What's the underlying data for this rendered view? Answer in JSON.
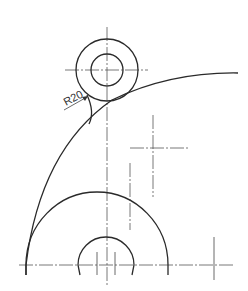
{
  "drawing": {
    "type": "mechanical-drawing",
    "colors": {
      "background": "#ffffff",
      "line": "#2a2a2a",
      "centerline": "#555555"
    },
    "annotations": [
      {
        "id": "fillet-radius",
        "label": "R20"
      }
    ],
    "features": {
      "top_boss": {
        "outer_circle": "outer-circle",
        "inner_circle": "inner-hole"
      },
      "base": {
        "outer_arc": "large-semicircle",
        "inner_arc": "small-semicircle"
      },
      "outline_arc": "large-outline-arc",
      "fillet": "fillet-arc"
    }
  }
}
